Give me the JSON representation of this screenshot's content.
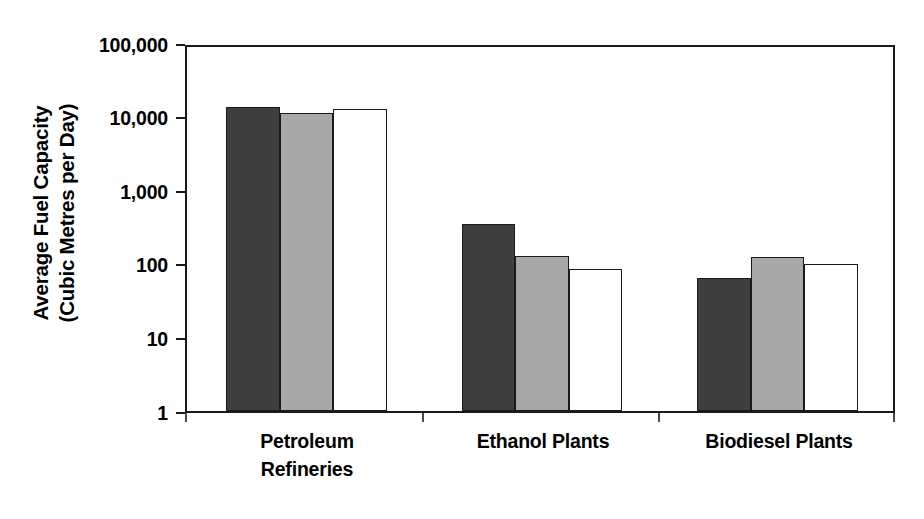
{
  "chart_data": {
    "type": "bar",
    "title": "",
    "subtitle": "",
    "xlabel": "",
    "ylabel": "Average Fuel Capacity (Cubic Metres per Day)",
    "ylabel_lines": [
      "Average Fuel Capacity",
      "(Cubic Metres per Day)"
    ],
    "yscale": "log",
    "ylim": [
      1,
      100000
    ],
    "ytick_values": [
      1,
      10,
      100,
      1000,
      10000,
      100000
    ],
    "ytick_labels": [
      "1",
      "10",
      "100",
      "1,000",
      "10,000",
      "100,000"
    ],
    "grid": false,
    "legend": "none",
    "categories": [
      "Petroleum Refineries",
      "Ethanol Plants",
      "Biodiesel Plants"
    ],
    "category_label_lines": [
      [
        "Petroleum",
        "Refineries"
      ],
      [
        "Ethanol Plants"
      ],
      [
        "Biodiesel Plants"
      ]
    ],
    "series": [
      {
        "name": "Series 1",
        "color": "#3f3f3f",
        "values": [
          15000,
          370,
          68
        ]
      },
      {
        "name": "Series 2",
        "color": "#a8a8a8",
        "values": [
          12500,
          135,
          130
        ]
      },
      {
        "name": "Series 3",
        "color": "#ffffff",
        "values": [
          14000,
          90,
          105
        ]
      }
    ],
    "colors": {
      "series_1": "#3f3f3f",
      "series_2": "#a8a8a8",
      "series_3": "#ffffff",
      "axis": "#1a1a1a",
      "bar_outline": "#1a1a1a",
      "background": "#ffffff",
      "text": "#000000"
    }
  }
}
